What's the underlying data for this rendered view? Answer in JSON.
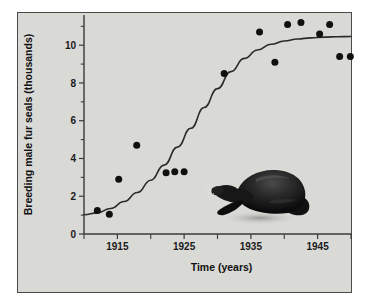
{
  "figure": {
    "panel_background": "#d9d9d6",
    "outer_background": "#ffffff",
    "border_color": "#4a4a4a",
    "illustration": "fur-seal-silhouette"
  },
  "chart_data": {
    "type": "scatter",
    "title": "",
    "subtitle": "",
    "xlabel": "Time (years)",
    "ylabel": "Breeding male fur seals (thousands)",
    "xlim": [
      1910,
      1950
    ],
    "ylim": [
      0,
      11.6
    ],
    "grid": false,
    "legend": null,
    "x_ticks_major": [
      1915,
      1925,
      1935,
      1945
    ],
    "x_tick_labels": [
      "1915",
      "1925",
      "1935",
      "1945"
    ],
    "x_ticks_minor": [
      1910,
      1920,
      1930,
      1940,
      1950
    ],
    "y_ticks_major": [
      0,
      2,
      4,
      6,
      8,
      10
    ],
    "y_tick_labels": [
      "0",
      "2",
      "4",
      "6",
      "8",
      "10"
    ],
    "y_ticks_minor": [
      1,
      3,
      5,
      7,
      9,
      11
    ],
    "point_color": "#101010",
    "curve_color": "#2b2b2b",
    "series": [
      {
        "name": "Breeding male fur seals",
        "marker": "circle",
        "points": [
          {
            "x": 1912.0,
            "y": 1.25
          },
          {
            "x": 1913.8,
            "y": 1.05
          },
          {
            "x": 1915.2,
            "y": 2.9
          },
          {
            "x": 1917.9,
            "y": 4.7
          },
          {
            "x": 1922.3,
            "y": 3.25
          },
          {
            "x": 1923.6,
            "y": 3.3
          },
          {
            "x": 1925.0,
            "y": 3.3
          },
          {
            "x": 1931.0,
            "y": 8.5
          },
          {
            "x": 1936.3,
            "y": 10.7
          },
          {
            "x": 1938.6,
            "y": 9.1
          },
          {
            "x": 1940.5,
            "y": 11.1
          },
          {
            "x": 1942.5,
            "y": 11.2
          },
          {
            "x": 1945.3,
            "y": 10.6
          },
          {
            "x": 1946.8,
            "y": 11.1
          },
          {
            "x": 1948.3,
            "y": 9.4
          },
          {
            "x": 1949.9,
            "y": 9.4
          }
        ]
      }
    ],
    "fit_curve": {
      "name": "logistic growth fit",
      "model": "logistic",
      "asymptote": 10.45,
      "points": [
        {
          "x": 1910.0,
          "y": 1.02
        },
        {
          "x": 1912.0,
          "y": 1.12
        },
        {
          "x": 1914.0,
          "y": 1.35
        },
        {
          "x": 1916.0,
          "y": 1.72
        },
        {
          "x": 1918.0,
          "y": 2.2
        },
        {
          "x": 1920.0,
          "y": 2.85
        },
        {
          "x": 1922.0,
          "y": 3.65
        },
        {
          "x": 1924.0,
          "y": 4.6
        },
        {
          "x": 1926.0,
          "y": 5.6
        },
        {
          "x": 1928.0,
          "y": 6.7
        },
        {
          "x": 1930.0,
          "y": 7.7
        },
        {
          "x": 1932.0,
          "y": 8.6
        },
        {
          "x": 1934.0,
          "y": 9.3
        },
        {
          "x": 1936.0,
          "y": 9.75
        },
        {
          "x": 1938.0,
          "y": 10.05
        },
        {
          "x": 1940.0,
          "y": 10.22
        },
        {
          "x": 1942.0,
          "y": 10.33
        },
        {
          "x": 1944.0,
          "y": 10.39
        },
        {
          "x": 1946.0,
          "y": 10.43
        },
        {
          "x": 1948.0,
          "y": 10.45
        },
        {
          "x": 1950.0,
          "y": 10.46
        }
      ]
    }
  }
}
